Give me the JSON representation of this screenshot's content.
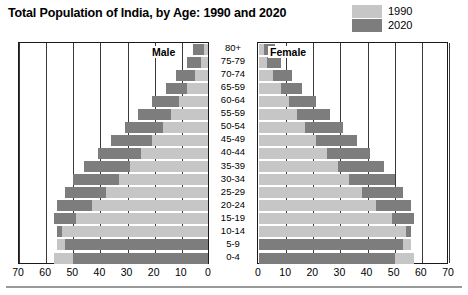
{
  "title": "Total Population of India, by Age: 1990 and 2020",
  "legend": {
    "position": "top-right",
    "items": [
      {
        "label": "1990",
        "color": "#c6c6c6",
        "name": "legend-swatch-1990"
      },
      {
        "label": "2020",
        "color": "#7d7d7d",
        "name": "legend-swatch-2020"
      }
    ]
  },
  "panes": {
    "male_caption": "Male",
    "female_caption": "Female"
  },
  "axis": {
    "left_ticks": [
      "70",
      "60",
      "50",
      "40",
      "30",
      "20",
      "10",
      "0"
    ],
    "right_ticks": [
      "0",
      "10",
      "20",
      "30",
      "40",
      "50",
      "60",
      "70"
    ],
    "max": 70,
    "step": 10,
    "unit": "millions"
  },
  "chart_data": {
    "type": "bar",
    "subtype": "population-pyramid",
    "title": "Total Population of India, by Age: 1990 and 2020",
    "xlabel": "",
    "ylabel": "",
    "xlim": [
      0,
      70
    ],
    "grid": true,
    "legend_position": "top-right",
    "categories": [
      "80+",
      "75-79",
      "70-74",
      "65-59",
      "60-64",
      "55-59",
      "50-54",
      "45-49",
      "40-44",
      "35-39",
      "30-34",
      "25-29",
      "20-24",
      "15-19",
      "10-14",
      "5-9",
      "0-4"
    ],
    "series": [
      {
        "name": "Male 1990",
        "side": "left",
        "year": "1990",
        "color": "#c6c6c6",
        "values": [
          2,
          3,
          5,
          8,
          11,
          14,
          17,
          21,
          25,
          29,
          33,
          38,
          43,
          49,
          54,
          56,
          57
        ]
      },
      {
        "name": "Male 2020",
        "side": "left",
        "year": "2020",
        "color": "#7d7d7d",
        "values": [
          6,
          8,
          12,
          16,
          21,
          26,
          31,
          36,
          41,
          46,
          50,
          53,
          56,
          57,
          56,
          53,
          50
        ]
      },
      {
        "name": "Female 1990",
        "side": "right",
        "year": "1990",
        "color": "#c6c6c6",
        "values": [
          2,
          3,
          5,
          8,
          11,
          14,
          17,
          21,
          25,
          29,
          33,
          38,
          43,
          49,
          54,
          56,
          57
        ]
      },
      {
        "name": "Female 2020",
        "side": "right",
        "year": "2020",
        "color": "#7d7d7d",
        "values": [
          6,
          8,
          12,
          16,
          21,
          26,
          31,
          36,
          41,
          46,
          50,
          53,
          56,
          57,
          56,
          53,
          50
        ]
      }
    ]
  }
}
